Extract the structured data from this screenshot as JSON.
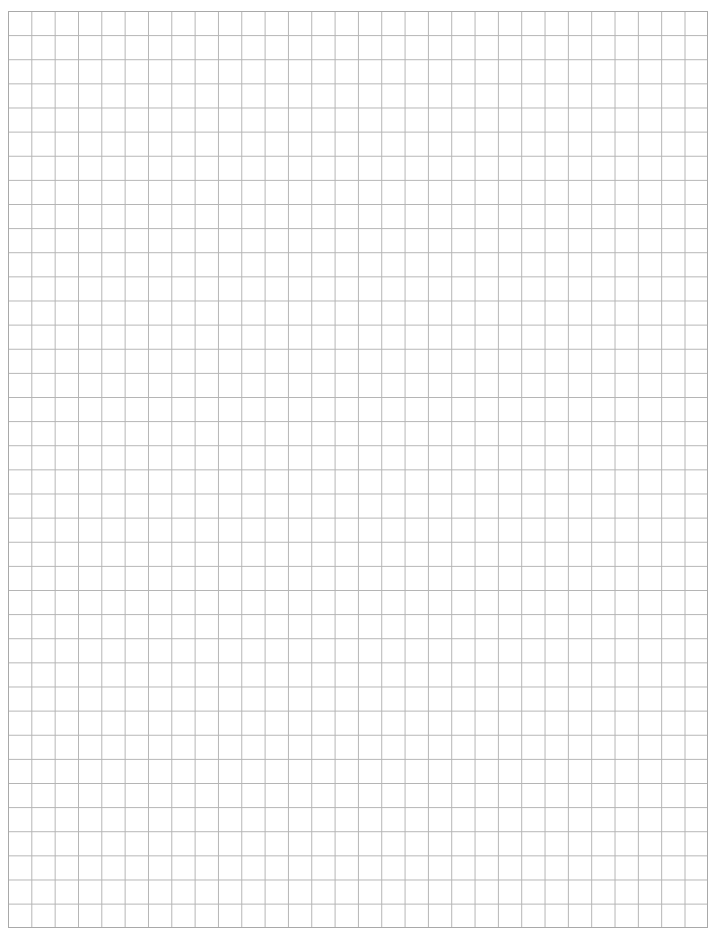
{
  "document": {
    "type": "graph-paper",
    "grid": {
      "columns": 30,
      "rows": 38,
      "line_color": "#b4b4b4",
      "border_color": "#a9a9a9",
      "background_color": "#ffffff"
    }
  }
}
